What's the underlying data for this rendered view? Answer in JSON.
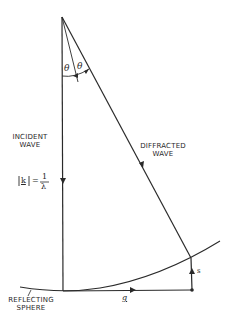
{
  "diagram": {
    "labels": {
      "incident": "INCIDENT\nWAVE",
      "diffracted": "DIFFRACTED\nWAVE",
      "sphere": "REFLECTING\nSPHERE",
      "theta_left": "θ",
      "theta_right": "θ",
      "k_symbol": "k",
      "k_equals": "=",
      "lambda_numerator": "1",
      "lambda_denominator": "λ",
      "g_vector": "g",
      "s_vector": "s"
    },
    "colors": {
      "line": "#2a2a2a",
      "background": "#ffffff"
    }
  }
}
